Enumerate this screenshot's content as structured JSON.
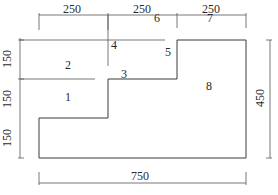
{
  "dimensions": {
    "top": [
      {
        "label": "250"
      },
      {
        "label": "250"
      },
      {
        "label": "250"
      }
    ],
    "left": [
      {
        "label": "150"
      },
      {
        "label": "150"
      },
      {
        "label": "150"
      }
    ],
    "right": {
      "label": "450"
    },
    "bottom": {
      "label": "750"
    }
  },
  "regions": [
    {
      "id": "1",
      "label": "1"
    },
    {
      "id": "2",
      "label": "2"
    },
    {
      "id": "3",
      "label": "3"
    },
    {
      "id": "4",
      "label": "4"
    },
    {
      "id": "5",
      "label": "5"
    },
    {
      "id": "6",
      "label": "6"
    },
    {
      "id": "7",
      "label": "7"
    },
    {
      "id": "8",
      "label": "8"
    }
  ],
  "colors": {
    "line": "#3a3a3a",
    "background": "#ffffff"
  }
}
